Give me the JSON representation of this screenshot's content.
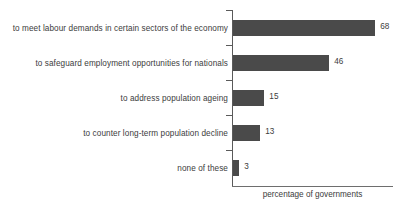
{
  "chart_data": {
    "type": "bar",
    "orientation": "horizontal",
    "title": "",
    "xlabel": "percentage of governments",
    "ylabel": "",
    "categories": [
      "to meet labour demands in certain sectors of the economy",
      "to safeguard employment opportunities for nationals",
      "to address population ageing",
      "to counter long-term population decline",
      "none of these"
    ],
    "values": [
      68,
      46,
      15,
      13,
      3
    ],
    "value_labels": [
      "68",
      "46",
      "15",
      "13",
      "3"
    ],
    "xlim": [
      0,
      77
    ],
    "grid": false,
    "legend": null,
    "bar_color": "#4a4a4a",
    "axis_color": "#5a5a5a",
    "text_color": "#3c3c3c"
  },
  "axis": {
    "caption": "percentage of governments"
  }
}
